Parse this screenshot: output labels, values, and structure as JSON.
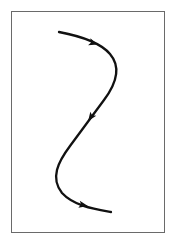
{
  "diagram": {
    "type": "directed-s-curve",
    "frame": {
      "x": 11,
      "y": 11,
      "width": 154,
      "height": 222,
      "border_color": "#6a6a6a"
    },
    "curve": {
      "color": "#111111",
      "stroke_width": 2.3,
      "path": "M 59 32 C 80 36, 100 42, 110 54 C 122 68, 116 84, 104 100 C 92 116, 82 130, 70 146 C 58 162, 50 178, 62 193 C 74 206, 94 209, 111 212"
    },
    "arrows": [
      {
        "name": "arrow-top",
        "x": 93,
        "y": 43,
        "angle": 18
      },
      {
        "name": "arrow-middle",
        "x": 91,
        "y": 117,
        "angle": 125
      },
      {
        "name": "arrow-bottom",
        "x": 83,
        "y": 205,
        "angle": 12
      }
    ]
  }
}
